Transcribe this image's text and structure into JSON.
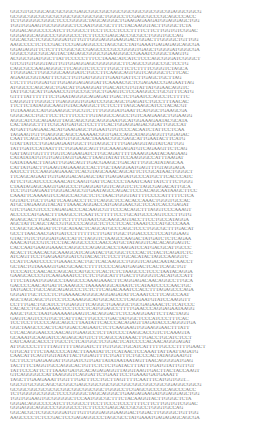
{
  "sequence": {
    "lines": [
      "GGCGTGCGGCAGCGCGGCGAGCGGCGGCGGCGGCGGCGGCGGCGGAGGCGGCG",
      "GCGGCGGCGCGCGCGGCGGCGGCGGCTGGGCCTCGAGCGCCCGCAGCCCACC",
      "TCTGGGGGCGGGCTCCCGGGGCTAGCAGGGCTGAAGAGAAGATGGAGGAGCTGG",
      "TGGTGGAAGTGCGGGGGCTCCAATGGCGCTTTCTACAAGGTACTTGGGCTCTA",
      "GGGACAGGCCCCATCTTCGGCCTTCCTTCCCTCCCTTTTCTTCTTGGTGTCGGAC",
      "GGGAGGCAGGCCCGGGGCCCTCTTCCCGAGCACCGCGCCTGGGTGCCAG",
      "GGCACGCTCGGCGGGATGTTGTTGGGAGGGAAGGACTGGACTTGGGGCTGTTGG",
      "AAGCCCCTCTCCGACTCCGAGAGGCCCTAGCGCCTATGAAATGAGAGAGCAGCGA",
      "GGAGAGGTTCTCTTTCGGCGCCGAGCCCCGCCGGGGTGAGCTGGGGATGGGCGA",
      "GGGCCGGCGGCAGTACTAGAGCGGGCGGAAGGGCCGAAATCGGGCTAAGTG",
      "ACGGCGGATGGCTTATTCCCCCTTTCCTAAACATCATCTCCCAGCGGGATCGGGCT",
      "GTCGTGTGGGTAGTTGTGGAGGAGCGGGGGGCTTCAGCCGGGCCGCTCCTG",
      "CAGCGCCAAGAGGGCTTCAGGTCTCCTTTGGCTTCTCTTTTCGGGTCTAGCA",
      "TTGGGACTTGGCGGCAAGGATCTGCCTTCAAGCAGTGGTCAGGGCTCTTCAC",
      "AGAAGCGGTAATTTCGCTTGTGATGGGTTGAATGATTCTTGAGCTGCTTAG",
      "CTCTTTGTGGATGTTGGAGGAGAGGATTCAAAACGCTCGAGAACCGAGAATTAG",
      "ATGGCCCAGCAGCTGACATTGAAGGATTGACATCGTGTATTATGGAACAGGTC",
      "TATTGCGCATTGAAACCGTGCCGCTGCTGAAGTCTCCAAGGCCTGCGTTTCATG",
      "GTTTTATTTTTTTCTGAATAGGGCAGAGATTGACTCTGAATCCAGCCTCTTTTC",
      "CAGGGTTTGGGCTTGAGGGGTGGATCCGGCAGCTGAGATCTGCCTTTAACAC",
      "TTCTTCTATAGGCAAGTGTACAAGGCTTCTCCTTTAGCAAGCATCCTACACGT",
      "TGTAAAGCCATGGAAGGCTGCGTCTTTGGGGATGAATTCATGGCTGAAGCGA",
      "GGGCACCTGCTTCCTCTTTCCCTTGTAGGCCAGCCTGTCAAGAAGCTGGAAGG",
      "AGGCATCGCAGAAGTTAGCAGCGGCAGGGAATGCATGGAAAGAATACGCATA",
      "CACTAGGCTTTTCGCATGATGCTCCTTTCACTGGAGGAGACGGATTGGCCAT",
      "ATGATTGAGAACACATGAAGAGCTGGAATGTGTCCCACAATCTATTCCTCAA",
      "TAGAAGTGTTGAGGGCAGCCAAAAACGGTGACCAGCATAGGAGGTTGGAGAC",
      "CAATTCAGCTGAGAATGTGGCAACTAAAACGGCGAGCATTGAATACTTCATG",
      "GTATTATCCTGGAGAGAATGGCTTGTAGGCTTTTGAGAGGTAGTATCATTGG",
      "TATTGATCCATAATTTCTGGAAGCAGTTGCAAAGAGATGTCAGAAGTTCTCAG",
      "GATTAGTGGTTTTGGTCAGAAGATCTTGCAGATTTTTAAAGGAATACAAGAAG",
      "CATATATATGTGTGAGTAGTGAACTTAAGTATATTCCAAGGGCCATTTAAGAT",
      "GATATAAACTTAGATTGGACAGTTGACGAAGCTGACATTTGGCATATAGCAA",
      "CATTATGACTTGAAGTAGAAAGCCACTTGCTAAGGAATGAGTTTGTAGGAGA",
      "AATCCTTCCAAGGAGAAACTCACGTAGCAAACAGCATTCTCGCATAACTGGGCT",
      "TTCAGCAGAATTGTGAGGACAGAGCTATTGAGAGATGCCCATGCTTCACCCATC",
      "ATTCTGCATCCCCAAACATCAAGTGATTCACCCCTAAATCAATTATCTTTCTGGG",
      "CTAATAGAGCAAGTGAGCCCTGAGGATGGTCAGGTCTCTAGCGAGACATTGCA",
      "TCCTGTGAGAATTGGGACAGCGTGAATAGCCAGACTCCCACAGCAATAAGCTTCC",
      "CAAATTCAAAAGTCCAGCCACGCTCTCTAACTGGGTATTTTCCCCATTTTTCTCA",
      "GGTATCTGCTTGATTCAAGACCTTCTCAGGCTCCACACCAAACTGGGTGCCAC",
      "ATGCTAGAAGGTACATTTAAACAGGACCATGAGGAACGCTCCATCACCGAGAT",
      "GTCTGACGTCCCTAGAGACCCACAAGCGTTCCCACAGCTTTAGGTCCCAAAGT",
      "ACCCCCATGAACTTTAAGCCTCAATTCTTTTTCCTGCATGCCCAGTCCCTTGTG",
      "AGAGCACTTGACAGTTCTTTTGTAATCGCAAGCAGTACCTTCCTGCCATAGGA",
      "AGCTATTCAGCTACCGTGCCCCAGGCTCTCCTCCACTAAATCCCATGCCCAAA",
      "CCAGCGCAAGATTCTGCATAACTCAGCATGCCCAGCTCCCTGGCGCTTTGACAT",
      "GCCTTAACAACGATGATCCTTTTTTCTTGATTGGCTGGACCCCTCCATGGAAG",
      "GTACTGTCTGGGATGACCATTCTAGGTCTAAGCCAAGACTATGATCTCTCAGAA",
      "AAACATGCCGTCTCCTACAGGCCCCCAACCATGCTATAGGTCACACAGGAGTC",
      "CACCAATGAAGGAAACCAGGCCCAGAGCACCTAAGATCCATGACGCATTGCCC",
      "ACACTTCAACACGCAAAGCATCAGATACTGCGGCTCCCACTCTACTCAGATCTC",
      "ATCAGTTCCTGAGAATGGATCGTACACTCTCCTTGCACATACTAGCCAAGGTC",
      "CCATTCAATCCCCTGAAACCACTGCTCACAAGCCTGGGTCAGACAATACAACCT",
      "GCTACTGTAAAAGTGACGCAACCTTTTCCCCAGATGAGACTCACTCAGCTGT",
      "TCCCATCCAACACCAGCACCATGCCTCACTCTCTAAGCCCTCCCTAATACAGGA",
      "GAAGCACCCGTCAAGAAATCCTCTCTGGCATTTGACTTGGGGTCACATGCCATT",
      "TTTCTATAATGGAGCCTAAGCCCAAAGAAACTTCAGGAGACAACAGGCCTTGCA",
      "GACCCCAACATGATTCAAAGCCTAAAAAGGCATAATCTCATAATCCCCAACTGC",
      "TATGACCTGCCAGCAGAGCCCTCTCTTCAGACAAATCCACCTTTAGAGCCCAGA",
      "GGGATTGCTCCCTCTGAAAACAGGGCAGGAGATATTCAAATCCTTCAGCCAAT",
      "AGCTAGCAGCTGTCCTCCAAAGGCATGGCACCCTCAGGAATGTATCCAAGGTT",
      "CCTTTGACTGCATCCTGGAGGTTCAGGCTGAAGGCTGCGAGAAACTCTCATCCC",
      "CACACCTGCAGAAACTCCTCCCTCATGGAGCCTTTTGAACCCAGGAGAATAAGG",
      "AAGCTGCCTAATGAAAAAGAAGTCACAGGACTCTCCAAGGAATTCTTACTAGG",
      "GAGTCAGTCCGTGCTCATTTACTTGCCCTGACTATGGCTCCCATCCCTTTCAC",
      "TCCTCCTTCCCCAGCAGCCTTAATATTCACCCACAGAGTTAGATACCCAGGGTGA",
      "GGCTAAGCCCACTCATGGACCAGAATCTCTCAAGAAGTGGAAGGAACTTTATT",
      "CTCACAGGAACCCAACAGTGAAGCCTCTTATCCCTAAGCACCGTCTCAAAGTA",
      "GCAAATGCAAGATCCAGAGCATGTCTTCAGCCATAAACTTGACCTGCATCTCCT",
      "CATCAAGCACCCTTGCCTCTCATGGCTCGGACTCATCCCCACAACAGGGAGAT",
      "ATTGCCCCTTTTTAGTTTTTAGGATCTTTGTGGCTGCATCATTTTTGCCCTTTTGAACT",
      "GTGCATTTTCTAACCCCATACTTAAATATTCTCATAACTCCAAATTATTAATTAGATG",
      "CAACATTCAGTGGTATATTACTGGAGTTTCTGATTTCTGCCCACTATAGGAATGT",
      "GCTTCCTGAGAAGATTGGGATCGTGATTATATAATAATAGTTAACAGGGGATGAG",
      "TACTTTCTAGGTGCCAGGCACTGTTCTCTCTGATACTTTATTTGATGTATTGTTGT",
      "TATTCCCATTCTTTAAATGATGCACAGAGAGGTTAGGTAAGTGACTTACTACCAAGT",
      "GTCAGGGGCCATTAAGGGTCAGGATTCTGAATTCCTGAAATGATGAAATT",
      "TAGCTTGAAGAAATTGGTTTGATTTCCTGCTTAGTTTTCAATTTCATGGTGGT..."
    ]
  }
}
